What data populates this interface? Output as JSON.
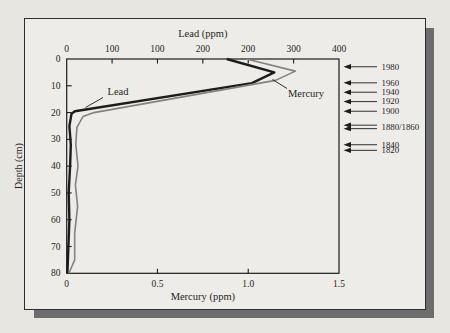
{
  "chart_data": {
    "type": "line",
    "title": "Lead (ppm)",
    "top_axis": {
      "label": "Lead (ppm)",
      "range": [
        0,
        400
      ],
      "tick_labels": [
        "0",
        "100",
        "100",
        "200",
        "200",
        "300",
        "400"
      ]
    },
    "bottom_axis": {
      "label": "Mercury (ppm)",
      "range": [
        0,
        1.5
      ],
      "tick_labels": [
        "0",
        "0.5",
        "1.0",
        "1.5"
      ]
    },
    "depth_axis": {
      "label": "Depth (cm)",
      "range": [
        0,
        80
      ],
      "tick_labels": [
        "0",
        "10",
        "20",
        "30",
        "40",
        "50",
        "60",
        "70",
        "80"
      ]
    },
    "series": [
      {
        "name": "Lead",
        "axis": "top",
        "color": "#1c1c1c",
        "width": 2.4,
        "points": [
          [
            0,
            235
          ],
          [
            5,
            305
          ],
          [
            9,
            272
          ],
          [
            19.5,
            12
          ],
          [
            20.5,
            7
          ],
          [
            25,
            4
          ],
          [
            32,
            6
          ],
          [
            40,
            5
          ],
          [
            50,
            3
          ],
          [
            60,
            4
          ],
          [
            70,
            2.5
          ],
          [
            80,
            1
          ]
        ]
      },
      {
        "name": "Mercury",
        "axis": "bottom",
        "color": "#828282",
        "width": 1.6,
        "points": [
          [
            0,
            0.99
          ],
          [
            4.5,
            1.26
          ],
          [
            8,
            1.15
          ],
          [
            20,
            0.15
          ],
          [
            21.5,
            0.09
          ],
          [
            25.5,
            0.056
          ],
          [
            32,
            0.05
          ],
          [
            40,
            0.062
          ],
          [
            47,
            0.048
          ],
          [
            55,
            0.06
          ],
          [
            65,
            0.044
          ],
          [
            75,
            0.044
          ],
          [
            80,
            0.012
          ]
        ]
      }
    ],
    "year_markers": [
      {
        "label": "1980",
        "depths": [
          2.9
        ]
      },
      {
        "label": "1960",
        "depths": [
          8.9
        ]
      },
      {
        "label": "1940",
        "depths": [
          12.4
        ]
      },
      {
        "label": "1920",
        "depths": [
          15.9
        ]
      },
      {
        "label": "1900",
        "depths": [
          19.5
        ]
      },
      {
        "label": "1880/1860",
        "depths": [
          24.7,
          26.0
        ]
      },
      {
        "label": "1840",
        "depths": [
          32.0
        ]
      },
      {
        "label": "1820",
        "depths": [
          34.1
        ]
      }
    ],
    "legend_position": "inline-annotations",
    "grid": false
  },
  "colors": {
    "background": "#e8e6e1",
    "frame_fill": "#eeece8",
    "frame_border": "#2e2e2e",
    "shadow": "#6d6d6d",
    "axis": "#1c1c1c",
    "text": "#1f1f1f"
  }
}
